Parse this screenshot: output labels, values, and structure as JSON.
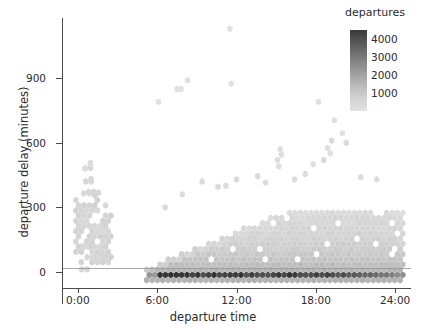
{
  "chart_data": {
    "type": "heatmap",
    "subtype": "hexbin",
    "title": "",
    "xlabel": "departure time",
    "ylabel": "departure delay (minutes)",
    "xlim": [
      -1.2,
      25.2
    ],
    "ylim": [
      -75,
      1180
    ],
    "xticks": [
      0,
      6,
      12,
      18,
      24
    ],
    "xtick_labels": [
      "0:00",
      "6:00",
      "12:00",
      "18:00",
      "24:00"
    ],
    "yticks": [
      0,
      300,
      600,
      900
    ],
    "ytick_labels": [
      "0",
      "300",
      "600",
      "900"
    ],
    "grid": false,
    "zero_reference_line": 0,
    "legend": {
      "title": "departures",
      "position": "top-right",
      "orientation": "vertical",
      "type": "colorbar",
      "ticks": [
        1000,
        2000,
        3000,
        4000
      ],
      "tick_labels": [
        "1000",
        "2000",
        "3000",
        "4000"
      ],
      "vmin": 0,
      "vmax": 4500,
      "colormap": "grayscale-light-to-dark",
      "color_low": "#e2e2e2",
      "color_high": "#2f2f2f"
    },
    "colors": {
      "axis": "#4a4a4a",
      "text": "#2b2b2b",
      "zero_line": "#9a9a9a",
      "background": "#ffffff"
    },
    "bins": [
      {
        "x": 0.25,
        "y": 10,
        "count": 180
      },
      {
        "x": 0.25,
        "y": 65,
        "count": 240
      },
      {
        "x": 0.7,
        "y": 65,
        "count": 260
      },
      {
        "x": 1.1,
        "y": 60,
        "count": 230
      },
      {
        "x": 0.25,
        "y": 115,
        "count": 300
      },
      {
        "x": 0.55,
        "y": 130,
        "count": 320
      },
      {
        "x": 0.3,
        "y": 150,
        "count": 340
      },
      {
        "x": 0.65,
        "y": 160,
        "count": 360
      },
      {
        "x": 1.0,
        "y": 150,
        "count": 300
      },
      {
        "x": 0.3,
        "y": 185,
        "count": 360
      },
      {
        "x": 0.6,
        "y": 195,
        "count": 380
      },
      {
        "x": 0.95,
        "y": 185,
        "count": 330
      },
      {
        "x": 1.3,
        "y": 190,
        "count": 280
      },
      {
        "x": 0.3,
        "y": 215,
        "count": 380
      },
      {
        "x": 0.65,
        "y": 225,
        "count": 400
      },
      {
        "x": 1.0,
        "y": 220,
        "count": 360
      },
      {
        "x": 1.35,
        "y": 225,
        "count": 290
      },
      {
        "x": 0.35,
        "y": 250,
        "count": 390
      },
      {
        "x": 0.7,
        "y": 260,
        "count": 410
      },
      {
        "x": 1.05,
        "y": 255,
        "count": 370
      },
      {
        "x": 1.4,
        "y": 255,
        "count": 300
      },
      {
        "x": 1.75,
        "y": 255,
        "count": 240
      },
      {
        "x": 0.35,
        "y": 285,
        "count": 370
      },
      {
        "x": 0.7,
        "y": 295,
        "count": 380
      },
      {
        "x": 1.05,
        "y": 290,
        "count": 350
      },
      {
        "x": 1.45,
        "y": 290,
        "count": 300
      },
      {
        "x": 1.8,
        "y": 292,
        "count": 250
      },
      {
        "x": 2.1,
        "y": 290,
        "count": 200
      },
      {
        "x": 0.4,
        "y": 320,
        "count": 300
      },
      {
        "x": 0.75,
        "y": 330,
        "count": 290
      },
      {
        "x": 1.1,
        "y": 325,
        "count": 260
      },
      {
        "x": 1.5,
        "y": 322,
        "count": 220
      },
      {
        "x": 0.5,
        "y": 365,
        "count": 220
      },
      {
        "x": 0.85,
        "y": 372,
        "count": 230
      },
      {
        "x": 1.2,
        "y": 368,
        "count": 200
      },
      {
        "x": 0.6,
        "y": 420,
        "count": 160
      },
      {
        "x": 1.0,
        "y": 430,
        "count": 150
      },
      {
        "x": 0.55,
        "y": 480,
        "count": 120
      },
      {
        "x": 0.95,
        "y": 500,
        "count": 110
      },
      {
        "x": 5.8,
        "y": -15,
        "count": 3900
      },
      {
        "x": 6.3,
        "y": -15,
        "count": 4200
      },
      {
        "x": 6.8,
        "y": -15,
        "count": 4300
      },
      {
        "x": 7.3,
        "y": -15,
        "count": 4100
      },
      {
        "x": 7.8,
        "y": -15,
        "count": 4000
      },
      {
        "x": 8.3,
        "y": -15,
        "count": 3800
      },
      {
        "x": 8.8,
        "y": -15,
        "count": 3700
      },
      {
        "x": 9.3,
        "y": -15,
        "count": 3400
      },
      {
        "x": 10.0,
        "y": -15,
        "count": 3100
      },
      {
        "x": 10.8,
        "y": -15,
        "count": 3000
      },
      {
        "x": 11.6,
        "y": -15,
        "count": 2900
      },
      {
        "x": 12.4,
        "y": -15,
        "count": 3000
      },
      {
        "x": 13.2,
        "y": -15,
        "count": 3200
      },
      {
        "x": 14.0,
        "y": -15,
        "count": 3100
      },
      {
        "x": 15.0,
        "y": -15,
        "count": 2800
      },
      {
        "x": 16.0,
        "y": -15,
        "count": 2900
      },
      {
        "x": 17.0,
        "y": -15,
        "count": 3000
      },
      {
        "x": 18.0,
        "y": -15,
        "count": 2700
      },
      {
        "x": 19.0,
        "y": -15,
        "count": 2400
      },
      {
        "x": 20.0,
        "y": -15,
        "count": 2200
      },
      {
        "x": 21.0,
        "y": -15,
        "count": 1900
      },
      {
        "x": 22.0,
        "y": -15,
        "count": 1500
      },
      {
        "x": 23.0,
        "y": -15,
        "count": 900
      },
      {
        "x": 6.2,
        "y": 30,
        "count": 900
      },
      {
        "x": 8.0,
        "y": 55,
        "count": 800
      },
      {
        "x": 10.0,
        "y": 90,
        "count": 700
      },
      {
        "x": 12.0,
        "y": 120,
        "count": 680
      },
      {
        "x": 14.0,
        "y": 150,
        "count": 650
      },
      {
        "x": 16.0,
        "y": 180,
        "count": 620
      },
      {
        "x": 18.0,
        "y": 200,
        "count": 600
      },
      {
        "x": 20.0,
        "y": 220,
        "count": 560
      },
      {
        "x": 22.0,
        "y": 235,
        "count": 520
      },
      {
        "x": 23.5,
        "y": 240,
        "count": 420
      },
      {
        "x": 6.1,
        "y": 790,
        "count": 60
      },
      {
        "x": 7.5,
        "y": 850,
        "count": 60
      },
      {
        "x": 7.8,
        "y": 850,
        "count": 60
      },
      {
        "x": 8.3,
        "y": 890,
        "count": 60
      },
      {
        "x": 11.5,
        "y": 1130,
        "count": 60
      },
      {
        "x": 11.6,
        "y": 875,
        "count": 60
      },
      {
        "x": 15.3,
        "y": 570,
        "count": 70
      },
      {
        "x": 15.2,
        "y": 490,
        "count": 70
      },
      {
        "x": 18.2,
        "y": 790,
        "count": 60
      },
      {
        "x": 19.4,
        "y": 705,
        "count": 60
      },
      {
        "x": 20.0,
        "y": 645,
        "count": 60
      },
      {
        "x": 18.9,
        "y": 575,
        "count": 70
      },
      {
        "x": 19.1,
        "y": 550,
        "count": 70
      },
      {
        "x": 17.8,
        "y": 500,
        "count": 80
      }
    ]
  }
}
